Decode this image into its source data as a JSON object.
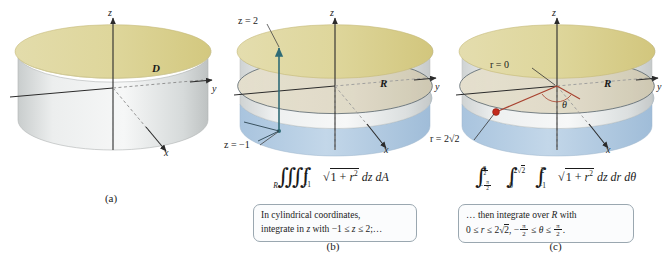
{
  "figure": {
    "panels": [
      {
        "id": "a",
        "caption": "(a)",
        "axes": {
          "x": "x",
          "y": "y",
          "z": "z"
        },
        "labels": [
          {
            "name": "solid-region",
            "text": "D"
          }
        ],
        "colors": {
          "top_surface": "#ddd49a",
          "body_light": "#f2f3f3",
          "body_shade": "#b9bdbd"
        }
      },
      {
        "id": "b",
        "caption": "(b)",
        "axes": {
          "x": "x",
          "y": "y",
          "z": "z"
        },
        "labels": [
          {
            "name": "z-upper-limit",
            "text": "z = 2"
          },
          {
            "name": "z-lower-limit",
            "text": "z = −1"
          },
          {
            "name": "region-R",
            "text": "R"
          }
        ],
        "formula": {
          "integral_sign": "∭",
          "outer_subscript": "R",
          "inner_lower": "−1",
          "inner_upper": "2",
          "integrand_prefix": "√",
          "integrand": "1 + r²",
          "differentials": "dz dA",
          "plain": "∭_R ∫_{-1}^{2} √(1 + r²) dz dA"
        },
        "note": {
          "line1": "In cylindrical coordinates,",
          "line2_pre": "integrate in ",
          "line2_var": "z",
          "line2_mid": " with −1 ≤ ",
          "line2_var2": "z",
          "line2_post": " ≤ 2;…",
          "plain": "In cylindrical coordinates, integrate in z with −1 ≤ z ≤ 2;..."
        },
        "colors": {
          "segment": "#2f6b76",
          "lower_fill": "#b9cfe4",
          "region_fill": "#ded7c2"
        }
      },
      {
        "id": "c",
        "caption": "(c)",
        "axes": {
          "x": "x",
          "y": "y",
          "z": "z"
        },
        "labels": [
          {
            "name": "r-origin",
            "text": "r = 0"
          },
          {
            "name": "r-outer",
            "text": "r = 2√2"
          },
          {
            "name": "theta-angle",
            "text": "θ"
          },
          {
            "name": "region-R",
            "text": "R"
          }
        ],
        "formula": {
          "theta_lower": "−π/2",
          "theta_upper": "π/2",
          "r_lower": "0",
          "r_upper": "2√2",
          "z_lower": "−1",
          "z_upper": "2",
          "integrand": "√(1 + r²)",
          "differentials": "dz dr dθ",
          "plain": "∫_{-π/2}^{π/2} ∫_{0}^{2√2} ∫_{-1}^{2} √(1 + r²) dz dr dθ"
        },
        "note": {
          "line1": "… then integrate over R with",
          "line2": "0 ≤ r ≤ 2√2, −π/2 ≤ θ ≤ π/2.",
          "plain": "... then integrate over R with 0 ≤ r ≤ 2√2, −π/2 ≤ θ ≤ π/2."
        },
        "colors": {
          "radius_line": "#a8422f",
          "dot": "#c32a1c",
          "lower_fill": "#b9cfe4"
        }
      }
    ],
    "symbols": {
      "sqrt": "√",
      "leq": "≤",
      "theta": "θ",
      "pi": "π",
      "minus": "−",
      "triple_integral": "∭",
      "integral": "∫"
    }
  }
}
